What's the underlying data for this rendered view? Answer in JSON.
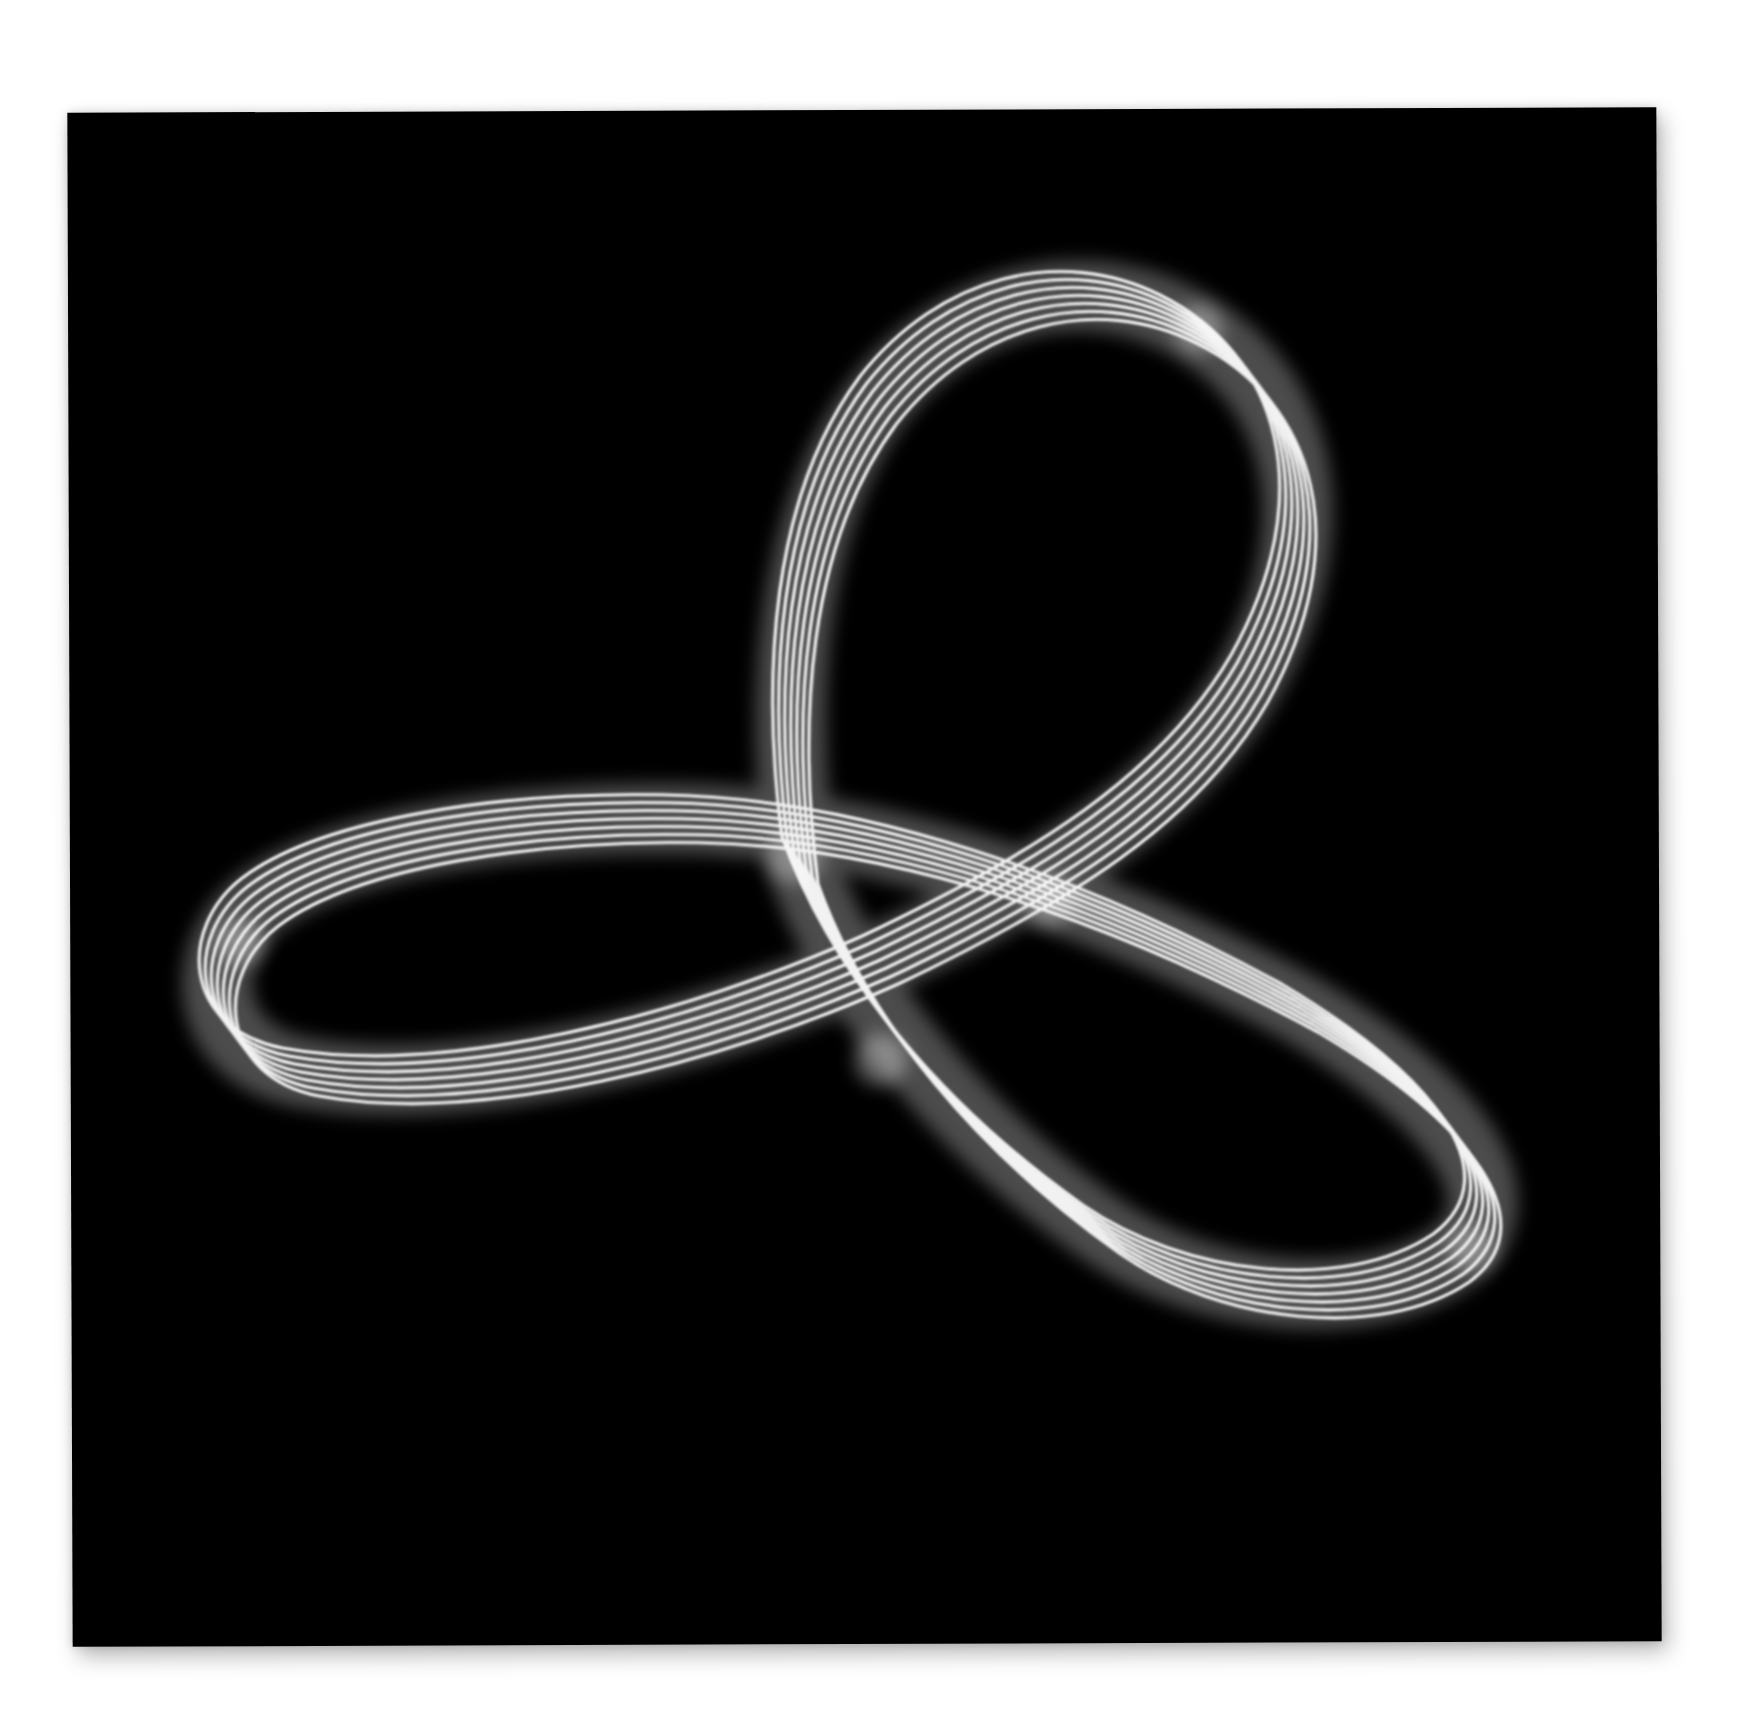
{
  "artwork": {
    "subject": "glowing multi-strand trefoil knot",
    "background_color": "#000000",
    "page_color": "#ffffff",
    "strand_color": "#f2f2f2",
    "glow_color": "#9a9a9a",
    "strand_count": 7,
    "loops": [
      {
        "name": "top-loop",
        "apex": [
          1060,
          290
        ]
      },
      {
        "name": "left-loop",
        "tip": [
          215,
          960
        ]
      },
      {
        "name": "bottom-right-loop",
        "tip": [
          1500,
          1200
        ]
      }
    ]
  }
}
